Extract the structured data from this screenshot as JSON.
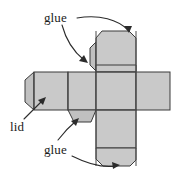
{
  "figure": {
    "kind": "box-net-diagram",
    "width": 181,
    "height": 174,
    "background_color": "#ffffff",
    "panel_fill_color": "#c9c9c9",
    "tab_fill_color": "#c0c0c0",
    "line_color": "#3a3a3a",
    "text_color": "#1b1b1b"
  },
  "labels": {
    "glue_top": "glue",
    "lid": "lid",
    "glue_bottom": "glue"
  },
  "annotations": [
    {
      "id": "glue-top-to-top-flap",
      "label": "glue",
      "target": "top-flap-edge"
    },
    {
      "id": "glue-top-to-side-tab",
      "label": "glue",
      "target": "upper-left-side-tab"
    },
    {
      "id": "lid-to-left-panel",
      "label": "lid",
      "target": "left-lid-panel"
    },
    {
      "id": "glue-bottom-to-tab",
      "label": "glue",
      "target": "lower-middle-tab"
    },
    {
      "id": "glue-bottom-to-flap",
      "label": "glue",
      "target": "bottom-flap-edge"
    }
  ],
  "parts": [
    {
      "id": "left-lid-tab",
      "name": "left-lid-tab",
      "type": "tab"
    },
    {
      "id": "left-lid-panel",
      "name": "left-lid-panel",
      "type": "panel"
    },
    {
      "id": "second-panel",
      "name": "second-panel",
      "type": "panel"
    },
    {
      "id": "center-panel",
      "name": "center-panel",
      "type": "panel"
    },
    {
      "id": "right-panel",
      "name": "right-panel",
      "type": "panel"
    },
    {
      "id": "upper-vertical-panel",
      "name": "upper-vertical-panel",
      "type": "panel"
    },
    {
      "id": "top-flap",
      "name": "top-flap",
      "type": "panel"
    },
    {
      "id": "upper-left-side-tab",
      "name": "upper-left-side-tab",
      "type": "tab"
    },
    {
      "id": "lower-vertical-panel",
      "name": "lower-vertical-panel",
      "type": "panel"
    },
    {
      "id": "bottom-flap",
      "name": "bottom-flap",
      "type": "panel"
    },
    {
      "id": "lower-middle-tab",
      "name": "lower-middle-tab",
      "type": "tab"
    }
  ]
}
